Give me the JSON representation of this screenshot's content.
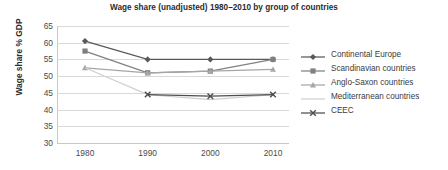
{
  "chart_data": {
    "type": "line",
    "title": "Wage share (unadjusted) 1980–2010 by group of countries",
    "xlabel": "",
    "ylabel": "Wage share % GDP",
    "x": [
      1980,
      1990,
      2000,
      2010
    ],
    "xtick_labels": [
      "1980",
      "1990",
      "2000",
      "2010"
    ],
    "ytick_labels": [
      "65",
      "60",
      "55",
      "50",
      "45",
      "40",
      "35",
      "30"
    ],
    "yticks": [
      65,
      60,
      55,
      50,
      45,
      40,
      35,
      30
    ],
    "ylim": [
      30,
      65
    ],
    "grid": true,
    "legend_position": "right",
    "series": [
      {
        "name": "Continental Europe",
        "marker": "diamond",
        "color": "#595959",
        "values": [
          60.5,
          55.0,
          55.0,
          55.0
        ]
      },
      {
        "name": "Scandinavian countries",
        "marker": "square",
        "color": "#808080",
        "values": [
          57.5,
          51.0,
          51.5,
          55.0
        ]
      },
      {
        "name": "Anglo-Saxon countries",
        "marker": "triangle",
        "color": "#a6a6a6",
        "values": [
          52.5,
          51.0,
          51.5,
          52.0
        ]
      },
      {
        "name": "Mediterranean countries",
        "marker": "none",
        "color": "#cfcfcf",
        "values": [
          52.5,
          44.5,
          43.0,
          44.5
        ]
      },
      {
        "name": "CEEC",
        "marker": "x",
        "color": "#4d4d4d",
        "values": [
          null,
          44.5,
          44.0,
          44.5
        ]
      }
    ]
  },
  "legend": {
    "items": [
      {
        "label": "Continental Europe"
      },
      {
        "label": "Scandinavian countries"
      },
      {
        "label": "Anglo-Saxon countries"
      },
      {
        "label": "Mediterranean countries"
      },
      {
        "label": "CEEC"
      }
    ]
  },
  "colors": {
    "gridline": "#d9d9d9",
    "axis": "#c8c8c8",
    "title_text": "#2b2b2b",
    "tick_text": "#4a4a4a",
    "background": "#ffffff"
  }
}
